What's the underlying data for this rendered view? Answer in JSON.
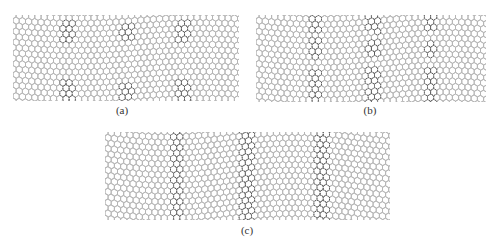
{
  "figure": {
    "panels": [
      {
        "id": "a",
        "label": "(a)",
        "box": {
          "x": 13,
          "y": 15,
          "w": 226,
          "h": 86
        },
        "label_pos": {
          "x": 122,
          "y": 104
        },
        "defect_columns": [
          55,
          113,
          170
        ],
        "defect_rows": [
          16,
          76
        ],
        "defect_style": "point",
        "waviness": 3
      },
      {
        "id": "b",
        "label": "(b)",
        "box": {
          "x": 256,
          "y": 15,
          "w": 230,
          "h": 87
        },
        "label_pos": {
          "x": 370,
          "y": 104
        },
        "defect_columns": [
          59,
          117,
          175
        ],
        "defect_rows": [
          8,
          34,
          62,
          80
        ],
        "defect_style": "point",
        "waviness": 4
      },
      {
        "id": "c",
        "label": "(c)",
        "box": {
          "x": 105,
          "y": 132,
          "w": 285,
          "h": 88
        },
        "label_pos": {
          "x": 247,
          "y": 224
        },
        "defect_columns": [
          72,
          141,
          217
        ],
        "defect_rows": [],
        "defect_style": "line",
        "waviness": 5
      }
    ],
    "colors": {
      "lattice": "#b4b4b4",
      "defect": "#5a5a5a",
      "background": "#ffffff",
      "caption": "#333333"
    },
    "lattice": {
      "bond_length": 3.6
    }
  }
}
